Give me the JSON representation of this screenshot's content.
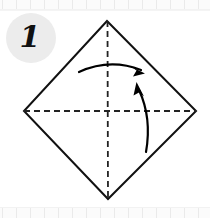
{
  "diagram": {
    "step_number": "1",
    "step_badge": {
      "shape": "circle",
      "fill_color": "#ececec",
      "text_color": "#111111"
    },
    "paper": {
      "shape_name": "square-rotated-diamond",
      "line_style": "solid",
      "stroke_color": "#111111",
      "stroke_width": 2,
      "fill_color": "#ffffff",
      "vertices": {
        "top": [
          107,
          21
        ],
        "right": [
          196,
          111
        ],
        "bottom": [
          108,
          199
        ],
        "left": [
          24,
          111
        ]
      }
    },
    "crease_lines": [
      {
        "name": "vertical-crease",
        "orientation": "vertical",
        "line_style": "dashed",
        "stroke_color": "#222222",
        "from": [
          107,
          21
        ],
        "to": [
          108,
          199
        ]
      },
      {
        "name": "horizontal-crease",
        "orientation": "horizontal",
        "line_style": "dashed",
        "stroke_color": "#222222",
        "from": [
          24,
          111
        ],
        "to": [
          196,
          111
        ]
      }
    ],
    "arrows": [
      {
        "name": "fold-arrow-horizontal",
        "direction": "right",
        "curve": "arc-over-top",
        "stroke_color": "#000000",
        "start": [
          79,
          70
        ],
        "end": [
          143,
          71
        ]
      },
      {
        "name": "fold-arrow-vertical",
        "direction": "up",
        "curve": "arc-right-side",
        "stroke_color": "#000000",
        "start": [
          146,
          152
        ],
        "end": [
          137,
          85
        ]
      }
    ],
    "ruler": {
      "top_visible": true,
      "bottom_visible": true,
      "tick_color": "#eaeaea",
      "band_color": "#fbfbfb",
      "tick_spacing": 14
    }
  }
}
